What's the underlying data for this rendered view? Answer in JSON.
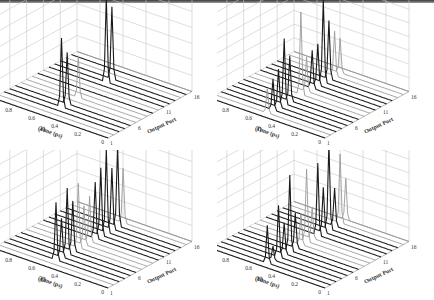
{
  "figure": {
    "top_rule_color": "#555555",
    "line_colors": {
      "dark": "#1a1a1a",
      "light": "#9a9a9a",
      "grid": "#c8c8c8"
    }
  },
  "chart_data": [
    {
      "type": "waterfall3d",
      "panel_label": "(e)",
      "title": "",
      "zlabel": "Output Power (W) x 10^-7",
      "ylabel": "Time (ps)",
      "xlabel": "Output Port",
      "zlim": [
        0,
        6
      ],
      "z_ticks": [
        "0",
        "1",
        "2",
        "3",
        "4",
        "5",
        "6"
      ],
      "time_ticks": [
        "0",
        "0.2",
        "0.4",
        "0.6",
        "0.8",
        "1"
      ],
      "port_ticks": [
        "1",
        "6",
        "11",
        "16"
      ],
      "ports": 16,
      "grid": true,
      "peaks": [
        {
          "port": 4,
          "time": 0.55,
          "height": 4.3,
          "tone": "dark"
        },
        {
          "port": 5,
          "time": 0.55,
          "height": 3.2,
          "tone": "dark"
        },
        {
          "port": 7,
          "time": 0.55,
          "height": 2.6,
          "tone": "light"
        },
        {
          "port": 12,
          "time": 0.55,
          "height": 5.3,
          "tone": "dark"
        },
        {
          "port": 13,
          "time": 0.55,
          "height": 4.5,
          "tone": "dark"
        }
      ]
    },
    {
      "type": "waterfall3d",
      "panel_label": "(f)",
      "title": "",
      "zlabel": "Output Power (W) x 10^-7",
      "ylabel": "Time (ps)",
      "xlabel": "Output Port",
      "zlim": [
        0,
        1.4
      ],
      "z_ticks": [
        "0",
        "0.2",
        "0.4",
        "0.6",
        "0.8",
        "1",
        "1.2",
        "1.4"
      ],
      "time_ticks": [
        "0",
        "0.2",
        "0.4",
        "0.6",
        "0.8",
        "1"
      ],
      "port_ticks": [
        "1",
        "6",
        "11",
        "16"
      ],
      "ports": 16,
      "grid": true,
      "peaks": [
        {
          "port": 2,
          "time": 0.55,
          "height": 0.35,
          "tone": "light"
        },
        {
          "port": 3,
          "time": 0.55,
          "height": 0.45,
          "tone": "dark"
        },
        {
          "port": 4,
          "time": 0.55,
          "height": 0.55,
          "tone": "dark"
        },
        {
          "port": 5,
          "time": 0.55,
          "height": 0.95,
          "tone": "dark"
        },
        {
          "port": 6,
          "time": 0.55,
          "height": 0.65,
          "tone": "dark"
        },
        {
          "port": 8,
          "time": 0.55,
          "height": 1.2,
          "tone": "light"
        },
        {
          "port": 9,
          "time": 0.55,
          "height": 0.5,
          "tone": "light"
        },
        {
          "port": 10,
          "time": 0.55,
          "height": 0.55,
          "tone": "dark"
        },
        {
          "port": 11,
          "time": 0.55,
          "height": 0.6,
          "tone": "dark"
        },
        {
          "port": 12,
          "time": 0.55,
          "height": 1.2,
          "tone": "dark"
        },
        {
          "port": 13,
          "time": 0.55,
          "height": 0.85,
          "tone": "dark"
        },
        {
          "port": 14,
          "time": 0.55,
          "height": 0.65,
          "tone": "light"
        },
        {
          "port": 15,
          "time": 0.55,
          "height": 0.5,
          "tone": "light"
        }
      ]
    },
    {
      "type": "waterfall3d",
      "panel_label": "(g)",
      "title": "",
      "zlabel": "Output Power (W) x 10^-7",
      "ylabel": "Time (ps)",
      "xlabel": "Output Port",
      "zlim": [
        0,
        6
      ],
      "z_ticks": [
        "0",
        "1",
        "2",
        "3",
        "4",
        "5",
        "6"
      ],
      "time_ticks": [
        "0",
        "0.2",
        "0.4",
        "0.6",
        "0.8",
        "1"
      ],
      "port_ticks": [
        "1",
        "6",
        "11",
        "16"
      ],
      "ports": 16,
      "grid": true,
      "peaks": [
        {
          "port": 3,
          "time": 0.55,
          "height": 3.6,
          "tone": "dark"
        },
        {
          "port": 4,
          "time": 0.55,
          "height": 2.4,
          "tone": "dark"
        },
        {
          "port": 5,
          "time": 0.55,
          "height": 4.1,
          "tone": "dark"
        },
        {
          "port": 6,
          "time": 0.55,
          "height": 3.1,
          "tone": "dark"
        },
        {
          "port": 7,
          "time": 0.55,
          "height": 4.0,
          "tone": "light"
        },
        {
          "port": 8,
          "time": 0.55,
          "height": 2.4,
          "tone": "light"
        },
        {
          "port": 9,
          "time": 0.55,
          "height": 2.8,
          "tone": "light"
        },
        {
          "port": 10,
          "time": 0.55,
          "height": 3.5,
          "tone": "dark"
        },
        {
          "port": 11,
          "time": 0.55,
          "height": 4.2,
          "tone": "dark"
        },
        {
          "port": 12,
          "time": 0.55,
          "height": 5.2,
          "tone": "dark"
        },
        {
          "port": 13,
          "time": 0.55,
          "height": 3.8,
          "tone": "dark"
        },
        {
          "port": 14,
          "time": 0.55,
          "height": 5.0,
          "tone": "dark"
        },
        {
          "port": 15,
          "time": 0.55,
          "height": 3.4,
          "tone": "light"
        }
      ]
    },
    {
      "type": "waterfall3d",
      "panel_label": "(h)",
      "title": "",
      "zlabel": "Output Power (W) x 10^-8",
      "ylabel": "Time (ps)",
      "xlabel": "Output Port",
      "zlim": [
        0,
        1.4
      ],
      "z_ticks": [
        "0",
        "0.2",
        "0.4",
        "0.6",
        "0.8",
        "1",
        "1.2",
        "1.4"
      ],
      "time_ticks": [
        "0",
        "0.2",
        "0.4",
        "0.6",
        "0.8",
        "1"
      ],
      "port_ticks": [
        "1",
        "6",
        "11",
        "16"
      ],
      "ports": 16,
      "grid": true,
      "peaks": [
        {
          "port": 2,
          "time": 0.55,
          "height": 0.55,
          "tone": "dark"
        },
        {
          "port": 3,
          "time": 0.55,
          "height": 0.2,
          "tone": "dark"
        },
        {
          "port": 4,
          "time": 0.55,
          "height": 0.75,
          "tone": "dark"
        },
        {
          "port": 5,
          "time": 0.55,
          "height": 0.45,
          "tone": "dark"
        },
        {
          "port": 6,
          "time": 0.55,
          "height": 1.1,
          "tone": "dark"
        },
        {
          "port": 7,
          "time": 0.55,
          "height": 0.5,
          "tone": "dark"
        },
        {
          "port": 8,
          "time": 0.55,
          "height": 0.45,
          "tone": "light"
        },
        {
          "port": 9,
          "time": 0.55,
          "height": 1.05,
          "tone": "light"
        },
        {
          "port": 10,
          "time": 0.55,
          "height": 0.45,
          "tone": "light"
        },
        {
          "port": 11,
          "time": 0.55,
          "height": 1.05,
          "tone": "dark"
        },
        {
          "port": 12,
          "time": 0.55,
          "height": 0.65,
          "tone": "dark"
        },
        {
          "port": 13,
          "time": 0.55,
          "height": 1.25,
          "tone": "dark"
        },
        {
          "port": 14,
          "time": 0.55,
          "height": 0.55,
          "tone": "dark"
        },
        {
          "port": 15,
          "time": 0.55,
          "height": 1.0,
          "tone": "light"
        },
        {
          "port": 16,
          "time": 0.55,
          "height": 0.6,
          "tone": "light"
        }
      ]
    }
  ]
}
